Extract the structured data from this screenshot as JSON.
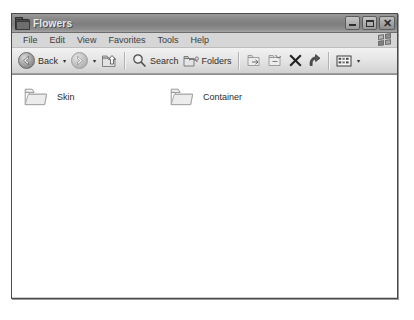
{
  "window": {
    "title": "Flowers",
    "title_icon": "folder-icon",
    "controls": [
      {
        "name": "minimize-button",
        "label": "_"
      },
      {
        "name": "maximize-button",
        "label": "□"
      },
      {
        "name": "close-button",
        "label": "✕"
      }
    ]
  },
  "menubar": {
    "items": [
      {
        "label": "File"
      },
      {
        "label": "Edit"
      },
      {
        "label": "View"
      },
      {
        "label": "Favorites"
      },
      {
        "label": "Tools"
      },
      {
        "label": "Help"
      }
    ],
    "logo": "windows-flag-icon"
  },
  "toolbar": {
    "back_label": "Back",
    "back_dropdown": "▾",
    "forward_label": "",
    "forward_dropdown": "▾",
    "up_label": "",
    "search_label": "Search",
    "folders_label": "Folders",
    "move_to_label": "",
    "copy_to_label": "",
    "delete_label": "",
    "undo_label": "",
    "views_dropdown": "▾"
  },
  "content": {
    "items": [
      {
        "name": "Skin",
        "icon": "folder-icon"
      },
      {
        "name": "Container",
        "icon": "folder-icon"
      }
    ]
  },
  "colors": {
    "titlebar": "#8b8b8b",
    "menubar": "#d6d6d6",
    "toolbar": "#e6e6e6",
    "content_bg": "#ffffff",
    "frame_border": "#4a4a4a"
  }
}
